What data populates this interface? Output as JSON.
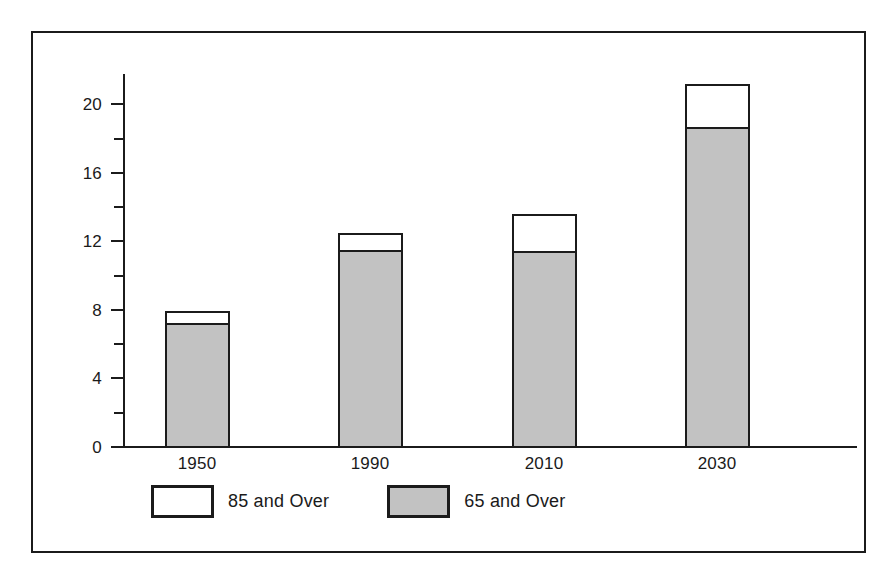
{
  "chart_data": {
    "type": "bar",
    "subtype": "stacked",
    "title": "",
    "xlabel": "",
    "ylabel": "",
    "categories": [
      "1950",
      "1990",
      "2010",
      "2030"
    ],
    "series": [
      {
        "name": "65 and Over",
        "color": "#c2c2c2",
        "values": [
          7.3,
          11.6,
          11.5,
          18.8
        ]
      },
      {
        "name": "85 and Over",
        "color": "#ffffff",
        "values": [
          0.7,
          1.0,
          2.2,
          2.5
        ]
      }
    ],
    "totals": [
      8.0,
      12.6,
      13.7,
      21.3
    ],
    "ylim": [
      0,
      22
    ],
    "y_ticks_major": [
      0,
      4,
      8,
      12,
      16,
      20
    ],
    "y_tick_labels": [
      "0",
      "4",
      "8",
      "12",
      "16",
      "20"
    ],
    "y_ticks_minor": [
      2,
      6,
      10,
      14,
      18,
      22
    ],
    "grid": false,
    "legend_position": "bottom-left"
  },
  "axes": {
    "y_labels": [
      "20",
      "16",
      "12",
      "8",
      "4",
      "0"
    ],
    "x_labels": [
      "1950",
      "1990",
      "2010",
      "2030"
    ]
  },
  "legend": {
    "entries": [
      {
        "label": "85 and Over",
        "swatch": "white"
      },
      {
        "label": "65 and Over",
        "swatch": "gray"
      }
    ]
  },
  "colors": {
    "ink": "#1b1b1b",
    "bar_gray": "#c2c2c2",
    "bar_white": "#ffffff",
    "background": "#ffffff"
  }
}
